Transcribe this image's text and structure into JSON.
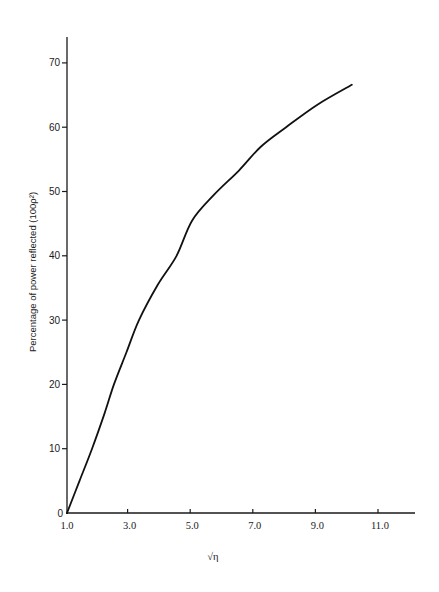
{
  "chart_data": {
    "type": "line",
    "title": "",
    "xlabel": "√η",
    "ylabel": "Percentage of power reflected (100ρ²)",
    "xlim": [
      1.0,
      12.2
    ],
    "ylim": [
      0,
      74
    ],
    "x_ticks": [
      "1.0",
      "3.0",
      "5.0",
      "7.0",
      "9.0",
      "11.0"
    ],
    "x_tick_values": [
      1,
      3,
      5,
      7,
      9,
      11
    ],
    "y_ticks": [
      "0",
      "10",
      "20",
      "30",
      "40",
      "50",
      "60",
      "70"
    ],
    "y_tick_values": [
      0,
      10,
      20,
      30,
      40,
      50,
      60,
      70
    ],
    "grid": false,
    "legend": null,
    "series": [
      {
        "name": "Power reflected",
        "x": [
          1.0,
          1.4,
          1.8,
          2.2,
          2.5,
          2.9,
          3.3,
          3.9,
          4.5,
          5.0,
          5.7,
          6.5,
          7.2,
          8.0,
          9.0,
          10.1
        ],
        "values": [
          0,
          5,
          10,
          15.5,
          20,
          25,
          30,
          35.5,
          40,
          45.5,
          49.5,
          53.3,
          57,
          60,
          63.5,
          66.6
        ]
      }
    ]
  }
}
